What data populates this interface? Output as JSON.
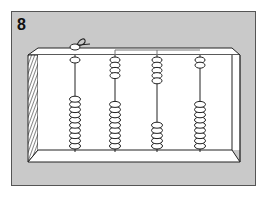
{
  "figure": {
    "label": "8",
    "colors": {
      "panel_background": "#c9c9c9",
      "abacus_face": "#ffffff",
      "outline": "#222222"
    },
    "rods": [
      {
        "position": 1,
        "upper_beads": 1,
        "lower_beads": 10,
        "has_knot": true
      },
      {
        "position": 2,
        "upper_beads": 4,
        "lower_beads": 9,
        "has_knot": false
      },
      {
        "position": 3,
        "upper_beads": 5,
        "lower_beads": 5,
        "has_knot": false
      },
      {
        "position": 4,
        "upper_beads": 2,
        "lower_beads": 9,
        "has_knot": false
      }
    ]
  }
}
